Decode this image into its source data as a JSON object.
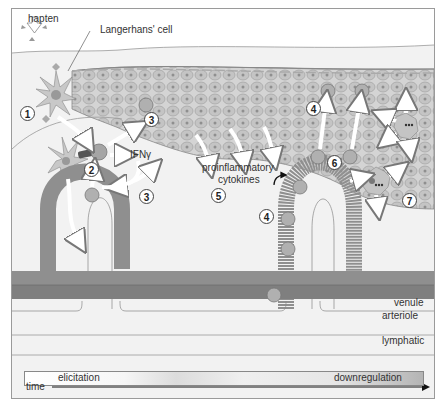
{
  "diagram": {
    "type": "contact-hypersensitivity-reaction",
    "labels": {
      "hapten": "hapten",
      "langerhans_cell": "Langerhans' cell",
      "ifn_gamma": "IFNγ",
      "proinflammatory_line1": "proinflammatory",
      "proinflammatory_line2": "cytokines",
      "venule": "venule",
      "arteriole": "arteriole",
      "lymphatic": "lymphatic"
    },
    "steps": [
      {
        "id": "1",
        "label": "1"
      },
      {
        "id": "2",
        "label": "2"
      },
      {
        "id": "3a",
        "label": "3"
      },
      {
        "id": "3b",
        "label": "3"
      },
      {
        "id": "4a",
        "label": "4"
      },
      {
        "id": "4b",
        "label": "4"
      },
      {
        "id": "5",
        "label": "5"
      },
      {
        "id": "6",
        "label": "6"
      },
      {
        "id": "7",
        "label": "7"
      }
    ],
    "timeline": {
      "start_label": "elicitation",
      "end_label": "downregulation",
      "axis_label": "time"
    },
    "colors": {
      "background": "#f2f2f2",
      "vessel": "#8f8f8f",
      "vessel_dark": "#7e7e7e",
      "epidermis_cell": "#c9c9c9",
      "t_cell": "#a8a8a8",
      "arrow": "#ffffff",
      "border": "#9a9a9a"
    }
  }
}
